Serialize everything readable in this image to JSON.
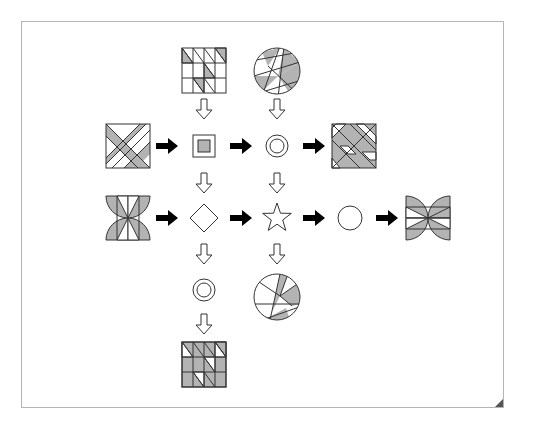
{
  "diagram": {
    "colors": {
      "fill_gray": "#b3b3b3",
      "stroke": "#333333",
      "arrow_black": "#000000",
      "frame_border": "#b5b5b5",
      "corner_fold": "#555555"
    },
    "nodes": [
      {
        "id": "top-grid",
        "shape": "grid-4x3-diagonals",
        "position": "top-left-column"
      },
      {
        "id": "top-circle",
        "shape": "circle-with-chords",
        "position": "top-right-column"
      },
      {
        "id": "left-square",
        "shape": "square-with-diagonal-bands",
        "position": "row1-input"
      },
      {
        "id": "square-in-square",
        "shape": "nested-square-gray-center",
        "position": "row1-col1"
      },
      {
        "id": "double-circle",
        "shape": "concentric-circles",
        "position": "row1-col2"
      },
      {
        "id": "right-square",
        "shape": "square-with-diagonal-bands",
        "position": "row1-output"
      },
      {
        "id": "left-hourglass",
        "shape": "hourglass-semicircles",
        "position": "row2-input"
      },
      {
        "id": "diamond",
        "shape": "diamond",
        "position": "row2-col1"
      },
      {
        "id": "star",
        "shape": "five-point-star",
        "position": "row2-col2"
      },
      {
        "id": "circle",
        "shape": "circle",
        "position": "row2-col3"
      },
      {
        "id": "right-bowtie",
        "shape": "bowtie-semicircles",
        "position": "row2-output"
      },
      {
        "id": "bottom-double-circle",
        "shape": "concentric-circles",
        "position": "row3-col1"
      },
      {
        "id": "bottom-circle",
        "shape": "circle-with-chords",
        "position": "row3-col2"
      },
      {
        "id": "bottom-grid",
        "shape": "grid-4x3-diagonals-inverted",
        "position": "row4-col1"
      }
    ],
    "arrows": {
      "black_right": 6,
      "white_down": 6
    }
  }
}
